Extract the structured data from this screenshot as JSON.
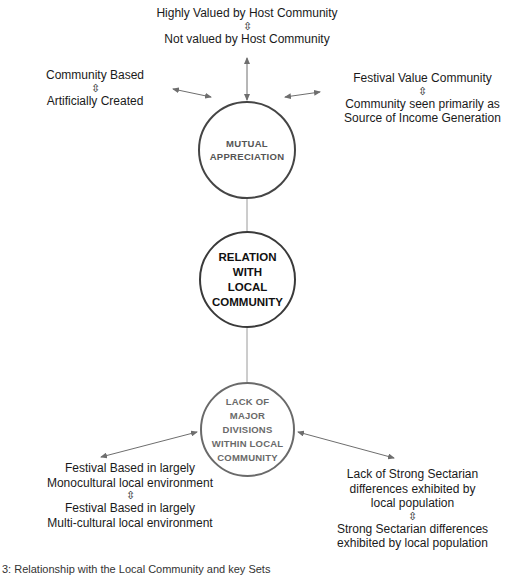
{
  "diagram": {
    "center_node": {
      "label": "RELATION\nWITH\nLOCAL\nCOMMUNITY"
    },
    "nodes": [
      {
        "id": "mutual-appreciation",
        "label": "MUTUAL\nAPPRECIATION",
        "dimensions": [
          {
            "position": "top",
            "pole_a": "Highly Valued by Host Community",
            "swap_symbol": "⇳",
            "pole_b": "Not valued by Host Community"
          },
          {
            "position": "left",
            "pole_a": "Community Based",
            "swap_symbol": "⇳",
            "pole_b": "Artificially Created"
          },
          {
            "position": "right",
            "pole_a": "Festival Value Community",
            "swap_symbol": "⇳",
            "pole_b": "Community seen primarily as Source of Income Generation"
          }
        ]
      },
      {
        "id": "lack-of-major-divisions",
        "label": "LACK OF\nMAJOR\nDIVISIONS\nWITHIN LOCAL\nCOMMUNITY",
        "dimensions": [
          {
            "position": "bottom-left",
            "pole_a": "Festival Based in largely Monocultural local environment",
            "swap_symbol": "⇳",
            "pole_b": "Festival Based in largely Multi-cultural local environment"
          },
          {
            "position": "bottom-right",
            "pole_a": "Lack of  Strong Sectarian differences exhibited by local population",
            "swap_symbol": "⇳",
            "pole_b": "Strong Sectarian differences exhibited by local population"
          }
        ]
      }
    ],
    "caption": "3: Relationship with the Local Community and key Sets"
  },
  "labels": {
    "top_a": "Highly Valued by Host Community",
    "top_b": "Not valued by Host Community",
    "left_a": "Community Based",
    "left_b": "Artificially Created",
    "right_a": "Festival Value Community",
    "right_b1": "Community seen primarily as",
    "right_b2": "Source of Income Generation",
    "bl_a1": "Festival Based in largely",
    "bl_a2": "Monocultural local environment",
    "bl_b1": "Festival Based in largely",
    "bl_b2": "Multi-cultural local environment",
    "br_a1": "Lack of  Strong Sectarian",
    "br_a2": "differences exhibited by",
    "br_a3": "local population",
    "br_b1": "Strong Sectarian differences",
    "br_b2": "exhibited by local population",
    "swap": "⇳"
  },
  "colors": {
    "connector_line": "#9a9a9a",
    "arrow": "#6e6e6e",
    "mutual_border": "#454545",
    "relation_border": "#3a3a3a",
    "lack_border": "#6a6a6a"
  }
}
